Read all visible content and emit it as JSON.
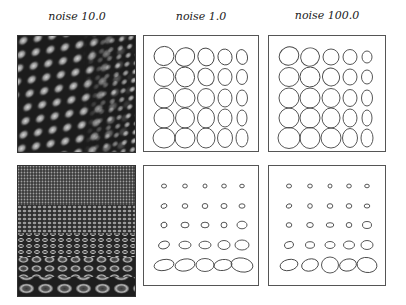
{
  "columns": [
    {
      "label": "noise 10.0"
    },
    {
      "label": "noise 1.0"
    },
    {
      "label": "noise 100.0"
    }
  ],
  "rows": [
    {
      "name": "frontal-texture"
    },
    {
      "name": "slanted-texture"
    }
  ],
  "colors": {
    "background": "#ffffff",
    "frame": "#555555",
    "ellipse_stroke": "#444444",
    "texture_dark": "#1a1a1a",
    "texture_light": "#bdbdbd"
  },
  "ellipse_grids": {
    "top_middle": {
      "cols": 5,
      "rows": 5
    },
    "top_right": {
      "cols": 5,
      "rows": 5
    },
    "bottom_middle": {
      "cols": 5,
      "rows": 5
    },
    "bottom_right": {
      "cols": 5,
      "rows": 5
    }
  }
}
